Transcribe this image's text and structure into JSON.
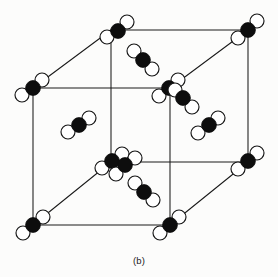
{
  "figure": {
    "label": "(b)",
    "label_y": 255,
    "kind": "crystal-unit-cell-diagram",
    "colors": {
      "background": "#fcfcfb",
      "edge": "#1a1a1a",
      "dark_atom": "#0d0d0d",
      "light_atom": "#ffffff",
      "outline": "#151515",
      "caption_text": "#1b1b1b"
    },
    "geometry": {
      "width": 278,
      "height": 277,
      "dark_radius": 7.4,
      "light_radius": 7.0,
      "edge_stroke_width": 1.05
    },
    "cube_vertices": {
      "front_bottom_left": [
        33,
        225
      ],
      "front_bottom_right": [
        170,
        225
      ],
      "front_top_left": [
        33,
        88
      ],
      "front_top_right": [
        170,
        88
      ],
      "back_bottom_left": [
        111,
        162
      ],
      "back_bottom_right": [
        248,
        162
      ],
      "back_top_left": [
        111,
        30
      ],
      "back_top_right": [
        248,
        30
      ]
    },
    "cube_edges": [
      [
        33,
        88,
        170,
        88
      ],
      [
        33,
        88,
        33,
        225
      ],
      [
        170,
        88,
        170,
        225
      ],
      [
        33,
        225,
        170,
        225
      ],
      [
        111,
        30,
        248,
        30
      ],
      [
        111,
        30,
        111,
        162
      ],
      [
        248,
        30,
        248,
        162
      ],
      [
        111,
        162,
        248,
        162
      ],
      [
        33,
        88,
        111,
        30
      ],
      [
        170,
        88,
        248,
        30
      ],
      [
        33,
        225,
        111,
        162
      ],
      [
        170,
        225,
        248,
        162
      ]
    ],
    "molecules": [
      {
        "id": "m-back-top-left-vertex",
        "site": "vertex",
        "dark": [
          118,
          31
        ],
        "light": [
          [
            107,
            37
          ],
          [
            127,
            22
          ]
        ]
      },
      {
        "id": "m-back-top-right-vertex",
        "site": "vertex",
        "dark": [
          248,
          30
        ],
        "light": [
          [
            238,
            38
          ],
          [
            257,
            21
          ]
        ]
      },
      {
        "id": "m-front-top-left-vertex",
        "site": "vertex",
        "dark": [
          33,
          88
        ],
        "light": [
          [
            22,
            95
          ],
          [
            42,
            80
          ]
        ]
      },
      {
        "id": "m-back-bottom-left-vertex",
        "site": "vertex",
        "dark": [
          112,
          161
        ],
        "light": [
          [
            102,
            168
          ],
          [
            122,
            154
          ]
        ]
      },
      {
        "id": "m-back-bottom-left-partner",
        "site": "vertex-partner",
        "dark": [
          125,
          165
        ],
        "light": [
          [
            116,
            174
          ],
          [
            135,
            158
          ]
        ]
      },
      {
        "id": "m-back-bottom-right-vertex",
        "site": "vertex",
        "dark": [
          248,
          161
        ],
        "light": [
          [
            238,
            169
          ],
          [
            257,
            153
          ]
        ]
      },
      {
        "id": "m-front-bottom-left-vertex",
        "site": "vertex",
        "dark": [
          33,
          225
        ],
        "light": [
          [
            23,
            233
          ],
          [
            43,
            217
          ]
        ]
      },
      {
        "id": "m-front-bottom-right-vertex",
        "site": "vertex",
        "dark": [
          170,
          225
        ],
        "light": [
          [
            160,
            233
          ],
          [
            179,
            217
          ]
        ]
      },
      {
        "id": "m-back-face-center",
        "site": "face",
        "dark": [
          169,
          88
        ],
        "light": [
          [
            159,
            96
          ],
          [
            178,
            80
          ]
        ]
      },
      {
        "id": "m-back-face-center-partner",
        "site": "face-partner",
        "dark": [
          183,
          98
        ],
        "light": [
          [
            175,
            90
          ],
          [
            192,
            107
          ]
        ]
      },
      {
        "id": "m-interior-top",
        "site": "interior",
        "dark": [
          143,
          60
        ],
        "light": [
          [
            134,
            51
          ],
          [
            152,
            69
          ]
        ]
      },
      {
        "id": "m-interior-left",
        "site": "interior",
        "dark": [
          79,
          125
        ],
        "light": [
          [
            68,
            132
          ],
          [
            89,
            118
          ]
        ]
      },
      {
        "id": "m-interior-right",
        "site": "interior",
        "dark": [
          209,
          125
        ],
        "light": [
          [
            198,
            133
          ],
          [
            218,
            118
          ]
        ]
      },
      {
        "id": "m-interior-bottom",
        "site": "interior",
        "dark": [
          144,
          192
        ],
        "light": [
          [
            135,
            183
          ],
          [
            153,
            200
          ]
        ]
      }
    ]
  }
}
